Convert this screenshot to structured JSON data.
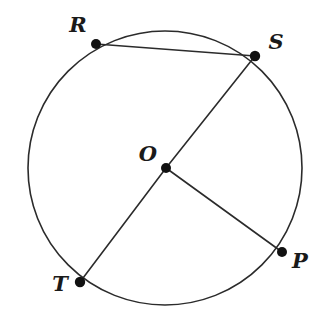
{
  "figure": {
    "background_color": "#ffffff",
    "stroke_color": "#2b2b2b",
    "point_color": "#111111",
    "label_color": "#1a1a1a",
    "width": 328,
    "height": 334
  },
  "circle": {
    "name": "circle-o",
    "center_x": 165,
    "center_y": 168,
    "radius": 137,
    "stroke_width": 1.6
  },
  "points": [
    {
      "id": "R",
      "label": "R",
      "x": 96,
      "y": 44,
      "label_x": 78,
      "label_y": 26,
      "radius": 5.0
    },
    {
      "id": "S",
      "label": "S",
      "x": 255,
      "y": 56,
      "label_x": 276,
      "label_y": 43,
      "radius": 5.2
    },
    {
      "id": "O",
      "label": "O",
      "x": 166,
      "y": 168,
      "label_x": 148,
      "label_y": 155,
      "radius": 5.0
    },
    {
      "id": "P",
      "label": "P",
      "x": 282,
      "y": 252,
      "label_x": 300,
      "label_y": 262,
      "radius": 5.0
    },
    {
      "id": "T",
      "label": "T",
      "x": 80,
      "y": 282,
      "label_x": 60,
      "label_y": 285,
      "radius": 5.2
    }
  ],
  "segments": [
    {
      "id": "RS",
      "name": "chord-r-s",
      "from": "R",
      "to": "S",
      "x1": 96,
      "y1": 44,
      "x2": 255,
      "y2": 56
    },
    {
      "id": "SO",
      "name": "radius-s-o",
      "from": "S",
      "to": "O",
      "x1": 255,
      "y1": 56,
      "x2": 166,
      "y2": 168
    },
    {
      "id": "OT",
      "name": "radius-o-t",
      "from": "O",
      "to": "T",
      "x1": 166,
      "y1": 168,
      "x2": 80,
      "y2": 282
    },
    {
      "id": "OP",
      "name": "radius-o-p",
      "from": "O",
      "to": "P",
      "x1": 166,
      "y1": 168,
      "x2": 282,
      "y2": 252
    }
  ]
}
